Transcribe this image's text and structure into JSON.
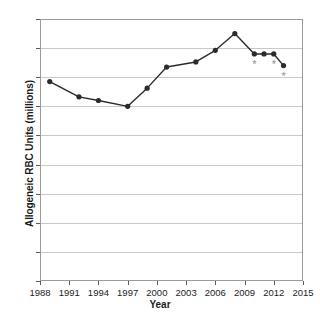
{
  "chart_data": {
    "type": "line",
    "title": "",
    "xlabel": "Year",
    "ylabel": "Allogeneic RBC Units (millions)",
    "xlim": [
      1988,
      2015
    ],
    "ylim": [
      0,
      18
    ],
    "grid": true,
    "legend": null,
    "xticks": [
      1988,
      1991,
      1994,
      1997,
      2000,
      2003,
      2006,
      2009,
      2012,
      2015
    ],
    "yticks": [
      0,
      2,
      4,
      6,
      8,
      10,
      12,
      14,
      16,
      18
    ],
    "marker": "filled-circle",
    "line_color": "#2b2b2b",
    "marker_color": "#2b2b2b",
    "grid_color": "#c9c9c9",
    "asterisk_color": "#8e8e8e",
    "x": [
      1989,
      1992,
      1994,
      1997,
      1999,
      2001,
      2004,
      2006,
      2008,
      2010,
      2011,
      2012,
      2013
    ],
    "values": [
      13.7,
      12.65,
      12.4,
      12.0,
      13.25,
      14.7,
      15.05,
      15.85,
      17.0,
      15.6,
      15.6,
      15.6,
      14.8
    ],
    "annotations": [
      {
        "label": "*",
        "x": 2010,
        "y": 14.9
      },
      {
        "label": "*",
        "x": 2012,
        "y": 14.9
      },
      {
        "label": "*",
        "x": 2013,
        "y": 14.1
      }
    ]
  },
  "axis": {
    "x_title": "Year",
    "y_title": "Allogeneic RBC Units (millions)"
  }
}
